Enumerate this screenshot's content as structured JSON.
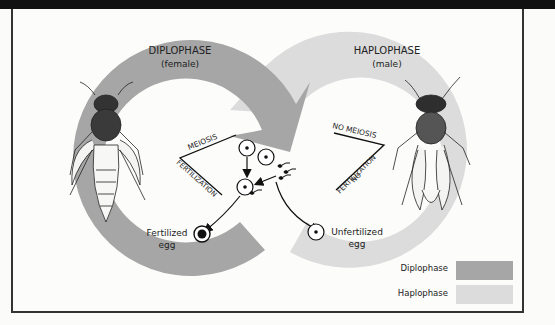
{
  "diplophase": {
    "title": "DIPLOPHASE",
    "subtitle": "(female)",
    "color": "#a6a6a6"
  },
  "haplophase": {
    "title": "HAPLOPHASE",
    "subtitle": "(male)",
    "color": "#dcdcdc"
  },
  "labels": {
    "meiosis": "MEIOSIS",
    "fertilization": "FERTILIZATION",
    "no_meiosis": "NO MEIOSIS",
    "no": "NO",
    "no_fertilization": "FERTILIZATION",
    "fertilized_egg_1": "Fertilized",
    "fertilized_egg_2": "egg",
    "unfertilized_egg_1": "Unfertilized",
    "unfertilized_egg_2": "egg"
  },
  "legend": [
    {
      "label": "Diplophase",
      "color": "#a6a6a6"
    },
    {
      "label": "Haplophase",
      "color": "#dcdcdc"
    }
  ]
}
